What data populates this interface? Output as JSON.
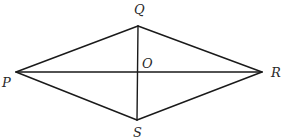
{
  "diagram": {
    "type": "rhombus-with-diagonals",
    "vertices": {
      "P": {
        "label": "P",
        "x": 16,
        "y": 72,
        "label_x": 2,
        "label_y": 87
      },
      "Q": {
        "label": "Q",
        "x": 138,
        "y": 26,
        "label_x": 134,
        "label_y": 14
      },
      "R": {
        "label": "R",
        "x": 262,
        "y": 72,
        "label_x": 274,
        "label_y": 77
      },
      "S": {
        "label": "S",
        "x": 137,
        "y": 120,
        "label_x": 133,
        "label_y": 137
      }
    },
    "center": {
      "label": "O",
      "x": 138,
      "y": 72,
      "label_x": 142,
      "label_y": 68
    },
    "edges": [
      {
        "from": "P",
        "to": "Q"
      },
      {
        "from": "Q",
        "to": "R"
      },
      {
        "from": "R",
        "to": "S"
      },
      {
        "from": "S",
        "to": "P"
      }
    ],
    "diagonals": [
      {
        "from": "P",
        "to": "R"
      },
      {
        "from": "Q",
        "to": "S"
      }
    ]
  }
}
